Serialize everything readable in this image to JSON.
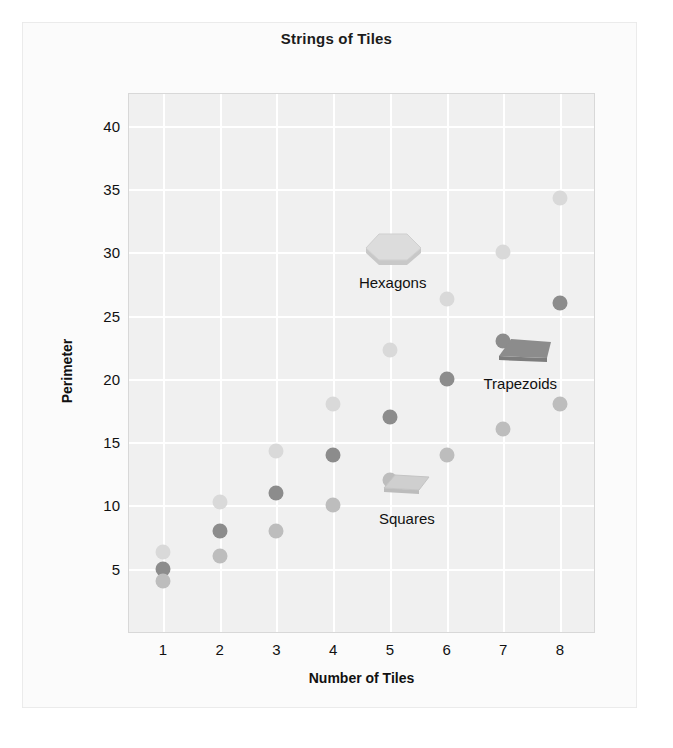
{
  "chart_data": {
    "type": "scatter",
    "title": "Strings of Tiles",
    "xlabel": "Number of Tiles",
    "ylabel": "Perimeter",
    "x": [
      1,
      2,
      3,
      4,
      5,
      6,
      7,
      8
    ],
    "xtick_labels": [
      "1",
      "2",
      "3",
      "4",
      "5",
      "6",
      "7",
      "8"
    ],
    "ytick_labels": [
      "5",
      "10",
      "15",
      "20",
      "25",
      "30",
      "35",
      "40"
    ],
    "ytick_values": [
      5,
      10,
      15,
      20,
      25,
      30,
      35,
      40
    ],
    "xlim": [
      0.4,
      8.6
    ],
    "ylim": [
      0,
      42.5
    ],
    "grid": true,
    "legend_position": "inline-annotations",
    "series": [
      {
        "name": "Hexagons",
        "color": "#d9d9d9",
        "icon": "hexagon-tile-icon",
        "values": [
          6.3,
          10.3,
          14.3,
          18,
          22.3,
          26.3,
          30,
          34.3
        ]
      },
      {
        "name": "Trapezoids",
        "color": "#8c8c8c",
        "icon": "trapezoid-tile-icon",
        "values": [
          5,
          8,
          11,
          14,
          17,
          20,
          23,
          26
        ]
      },
      {
        "name": "Squares",
        "color": "#bdbdbd",
        "icon": "square-tile-icon",
        "values": [
          4,
          6,
          8,
          10,
          12,
          14,
          16,
          18
        ]
      }
    ],
    "annotations": [
      {
        "text": "Hexagons",
        "series": "Hexagons",
        "at_x": 5.05,
        "at_y": 28.3
      },
      {
        "text": "Trapezoids",
        "series": "Trapezoids",
        "at_x": 7.3,
        "at_y": 20.3
      },
      {
        "text": "Squares",
        "series": "Squares",
        "at_x": 5.3,
        "at_y": 9.6
      }
    ]
  }
}
